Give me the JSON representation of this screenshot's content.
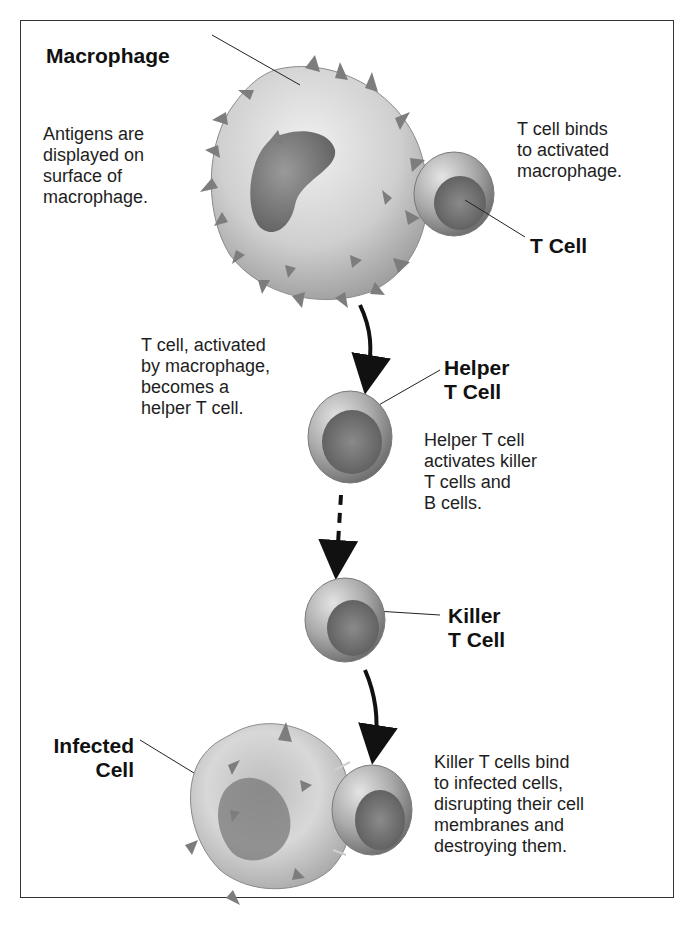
{
  "labels": {
    "macrophage": "Macrophage",
    "t_cell": "T Cell",
    "helper_line1": "Helper",
    "helper_line2": "T Cell",
    "killer_line1": "Killer",
    "killer_line2": "T Cell",
    "infected_line1": "Infected",
    "infected_line2": "Cell"
  },
  "captions": {
    "antigens": [
      "Antigens are",
      "displayed on",
      "surface of",
      "macrophage."
    ],
    "t_binds": [
      "T cell binds",
      "to activated",
      "macrophage."
    ],
    "activated": [
      "T cell, activated",
      "by macrophage,",
      "becomes a",
      "helper T cell."
    ],
    "helper_activates": [
      "Helper T cell",
      "activates killer",
      "T cells and",
      "B cells."
    ],
    "killer_bind": [
      "Killer T cells bind",
      "to infected cells,",
      "disrupting their cell",
      "membranes and",
      "destroying them."
    ]
  },
  "colors": {
    "cell_light": "#d9d9d9",
    "cell_mid": "#a8a8a8",
    "cell_dark": "#6e6e6e",
    "spike": "#7d7d7d",
    "arrow": "#111111"
  }
}
